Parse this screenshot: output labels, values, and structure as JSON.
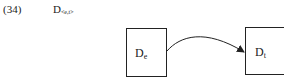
{
  "example": {
    "number": "(34)",
    "term": {
      "base": "D",
      "subscript": "<e,t>"
    }
  },
  "diagram": {
    "source_box": {
      "base": "D",
      "subscript": "e"
    },
    "target_box": {
      "base": "D",
      "subscript": "t"
    },
    "arrow": {
      "from": "source_box",
      "to": "target_box",
      "style": "curved"
    }
  }
}
